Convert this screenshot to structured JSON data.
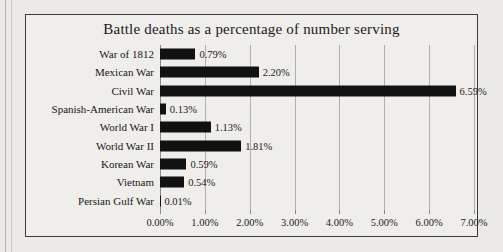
{
  "chart_data": {
    "type": "bar",
    "orientation": "horizontal",
    "title": "Battle deaths as a percentage of number serving",
    "xlabel": "",
    "ylabel": "",
    "grid": true,
    "legend": false,
    "xlim": [
      0,
      7
    ],
    "xtick_labels": [
      "0.00%",
      "1.00%",
      "2.00%",
      "3.00%",
      "4.00%",
      "5.00%",
      "6.00%",
      "7.00%"
    ],
    "xtick_values": [
      0,
      1,
      2,
      3,
      4,
      5,
      6,
      7
    ],
    "categories": [
      "War of 1812",
      "Mexican War",
      "Civil War",
      "Spanish-American War",
      "World War I",
      "World War II",
      "Korean War",
      "Vietnam",
      "Persian Gulf War"
    ],
    "values": [
      0.79,
      2.2,
      6.59,
      0.13,
      1.13,
      1.81,
      0.59,
      0.54,
      0.01
    ],
    "value_labels": [
      "0.79%",
      "2.20%",
      "6.59%",
      "0.13%",
      "1.13%",
      "1.81%",
      "0.59%",
      "0.54%",
      "0.01%"
    ],
    "bar_color": "#111111",
    "grid_color": "#b0aeaa",
    "background_color": "#f0eeea"
  }
}
